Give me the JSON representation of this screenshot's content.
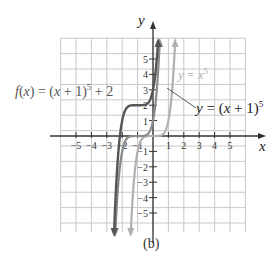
{
  "figure": {
    "caption": "(b)",
    "x_axis_label": "x",
    "y_axis_label": "y",
    "x_ticks": [
      "-5",
      "-4",
      "-3",
      "-2",
      "-1",
      "1",
      "2",
      "3",
      "4",
      "5"
    ],
    "y_ticks": [
      "5",
      "4",
      "3",
      "2",
      "1",
      "-1",
      "-2",
      "-3",
      "-4",
      "-5"
    ],
    "labels": {
      "f_prefix": "f(x) = (x + 1)",
      "f_exp": "5",
      "f_suffix": " + 2",
      "base_prefix": "y = x",
      "base_exp": "5",
      "shift_prefix": "y = (x + 1)",
      "shift_exp": "5"
    },
    "colors": {
      "grid": "#c8c8c8",
      "axis": "#333333",
      "curve_f": "#555555",
      "curve_shift": "#8a8a8a",
      "curve_base": "#b0b0b0"
    }
  },
  "chart_data": {
    "type": "line",
    "title": "",
    "xlabel": "x",
    "ylabel": "y",
    "xlim": [
      -6,
      6
    ],
    "ylim": [
      -6,
      6
    ],
    "grid": true,
    "series": [
      {
        "name": "f(x) = (x + 1)^5 + 2",
        "formula": "(x+1)^5+2",
        "x": [
          -2.5,
          -2,
          -1.5,
          -1,
          -0.5,
          0,
          0.2
        ],
        "y": [
          -5.59,
          1,
          1.97,
          2,
          2.03,
          3,
          4.49
        ]
      },
      {
        "name": "y = (x + 1)^5",
        "formula": "(x+1)^5",
        "x": [
          -2.3,
          -2,
          -1.5,
          -1,
          -0.5,
          0,
          0.4
        ],
        "y": [
          -3.71,
          -1,
          -0.03,
          0,
          0.03,
          1,
          5.38
        ]
      },
      {
        "name": "y = x^5",
        "formula": "x^5",
        "x": [
          -1.4,
          -1,
          -0.5,
          0,
          0.5,
          1,
          1.4
        ],
        "y": [
          -5.38,
          -1,
          -0.03,
          0,
          0.03,
          1,
          5.38
        ]
      }
    ],
    "annotations": [
      "f(x) = (x + 1)^5 + 2",
      "y = x^5",
      "y = (x + 1)^5",
      "(b)"
    ]
  }
}
